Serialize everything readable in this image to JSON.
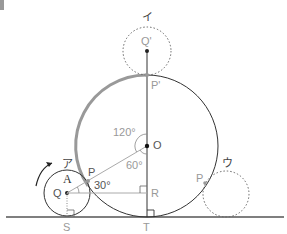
{
  "figure": {
    "corner_marker": "figure-corner-mark",
    "labels": {
      "i": "イ",
      "a": "ア",
      "u": "ウ",
      "q_prime": "Q'",
      "p_prime": "P'",
      "o": "O",
      "angle_120": "120°",
      "angle_60": "60°",
      "angle_30": "30°",
      "p_left": "P",
      "p_right": "P",
      "A": "A",
      "Q": "Q",
      "R": "R",
      "S": "S",
      "T": "T"
    },
    "colors": {
      "line": "#333333",
      "highlight_arc": "#999999",
      "dotted": "#666666",
      "thin_line": "#aaaaaa",
      "label": "#555555"
    }
  }
}
